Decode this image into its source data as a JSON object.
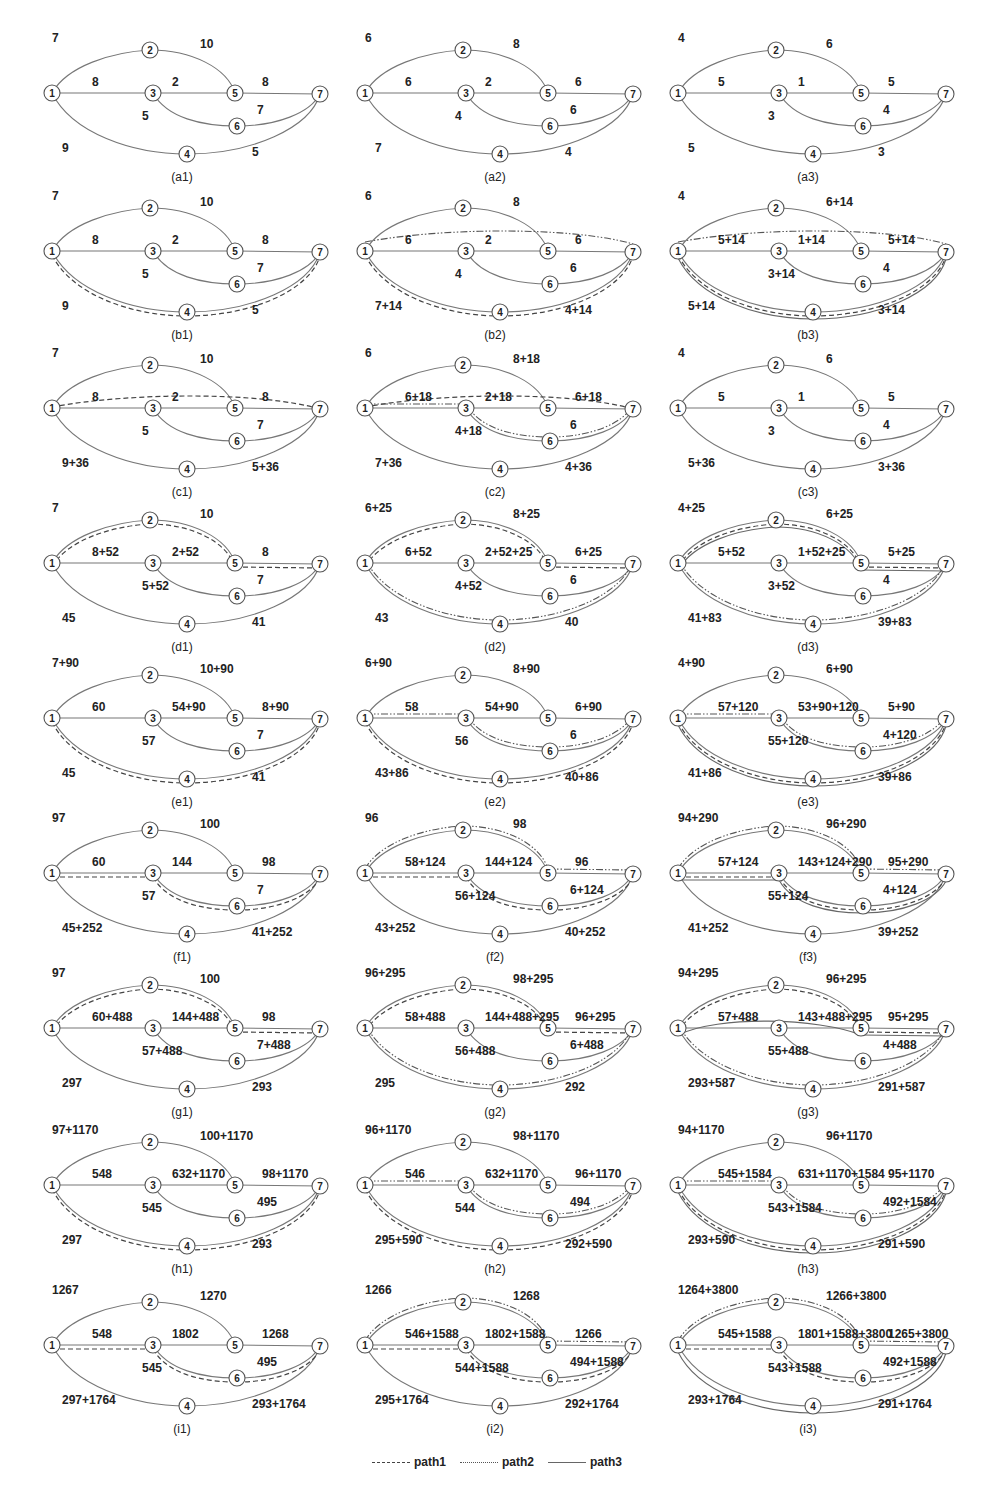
{
  "figure": {
    "nodes": [
      "1",
      "2",
      "3",
      "4",
      "5",
      "6",
      "7"
    ],
    "edges": [
      "1-2",
      "2-5",
      "1-3",
      "3-5",
      "5-7",
      "3-6",
      "6-7",
      "1-4",
      "4-7"
    ],
    "legend": [
      {
        "label": "path1",
        "style": "dashed"
      },
      {
        "label": "path2",
        "style": "dash-dot-dot"
      },
      {
        "label": "path3",
        "style": "solid"
      }
    ]
  },
  "panels": [
    {
      "id": "a1",
      "caption": "(a1)",
      "w": {
        "12": "7",
        "25": "10",
        "13": "8",
        "35": "2",
        "57": "8",
        "36": "5",
        "67": "7",
        "14": "9",
        "47": "5"
      },
      "paths": {
        "p1": [],
        "p2": [],
        "p3": []
      }
    },
    {
      "id": "a2",
      "caption": "(a2)",
      "w": {
        "12": "6",
        "25": "8",
        "13": "6",
        "35": "2",
        "57": "6",
        "36": "4",
        "67": "6",
        "14": "7",
        "47": "4"
      },
      "paths": {
        "p1": [],
        "p2": [],
        "p3": []
      }
    },
    {
      "id": "a3",
      "caption": "(a3)",
      "w": {
        "12": "4",
        "25": "6",
        "13": "5",
        "35": "1",
        "57": "5",
        "36": "3",
        "67": "4",
        "14": "5",
        "47": "3"
      },
      "paths": {
        "p1": [],
        "p2": [],
        "p3": []
      }
    },
    {
      "id": "b1",
      "caption": "(b1)",
      "w": {
        "12": "7",
        "25": "10",
        "13": "8",
        "35": "2",
        "57": "8",
        "36": "5",
        "67": "7",
        "14": "9",
        "47": "5"
      },
      "paths": {
        "p1": [
          "14",
          "47"
        ],
        "p2": [],
        "p3": []
      }
    },
    {
      "id": "b2",
      "caption": "(b2)",
      "w": {
        "12": "6",
        "25": "8",
        "13": "6",
        "35": "2",
        "57": "6",
        "36": "4",
        "67": "6",
        "14": "7+14",
        "47": "4+14"
      },
      "paths": {
        "p1": [
          "14",
          "47"
        ],
        "p2": [
          "17"
        ],
        "p3": []
      }
    },
    {
      "id": "b3",
      "caption": "(b3)",
      "w": {
        "12": "4",
        "25": "6+14",
        "13": "5+14",
        "35": "1+14",
        "57": "5+14",
        "36": "3+14",
        "67": "4",
        "14": "5+14",
        "47": "3+14"
      },
      "paths": {
        "p1": [
          "14",
          "47"
        ],
        "p2": [
          "17"
        ],
        "p3": [
          "14",
          "47"
        ]
      }
    },
    {
      "id": "c1",
      "caption": "(c1)",
      "w": {
        "12": "7",
        "25": "10",
        "13": "8",
        "35": "2",
        "57": "8",
        "36": "5",
        "67": "7",
        "14": "9+36",
        "47": "5+36"
      },
      "paths": {
        "p1": [
          "17"
        ],
        "p2": [],
        "p3": []
      }
    },
    {
      "id": "c2",
      "caption": "(c2)",
      "w": {
        "12": "6",
        "25": "8+18",
        "13": "6+18",
        "35": "2+18",
        "57": "6+18",
        "36": "4+18",
        "67": "6",
        "14": "7+36",
        "47": "4+36"
      },
      "paths": {
        "p1": [
          "17"
        ],
        "p2": [
          "13",
          "36",
          "67"
        ],
        "p3": []
      }
    },
    {
      "id": "c3",
      "caption": "(c3)",
      "w": {
        "12": "4",
        "25": "6",
        "13": "5",
        "35": "1",
        "57": "5",
        "36": "3",
        "67": "4",
        "14": "5+36",
        "47": "3+36"
      },
      "paths": {
        "p1": [],
        "p2": [],
        "p3": []
      }
    },
    {
      "id": "d1",
      "caption": "(d1)",
      "w": {
        "12": "7",
        "25": "10",
        "13": "8+52",
        "35": "2+52",
        "57": "8",
        "36": "5+52",
        "67": "7",
        "14": "45",
        "47": "41"
      },
      "paths": {
        "p1": [
          "12",
          "25",
          "57"
        ],
        "p2": [],
        "p3": []
      }
    },
    {
      "id": "d2",
      "caption": "(d2)",
      "w": {
        "12": "6+25",
        "25": "8+25",
        "13": "6+52",
        "35": "2+52+25",
        "57": "6+25",
        "36": "4+52",
        "67": "6",
        "14": "43",
        "47": "40"
      },
      "paths": {
        "p1": [
          "12",
          "25",
          "57"
        ],
        "p2": [
          "14",
          "47"
        ],
        "p3": []
      }
    },
    {
      "id": "d3",
      "caption": "(d3)",
      "w": {
        "12": "4+25",
        "25": "6+25",
        "13": "5+52",
        "35": "1+52+25",
        "57": "5+25",
        "36": "3+52",
        "67": "4",
        "14": "41+83",
        "47": "39+83"
      },
      "paths": {
        "p1": [
          "12",
          "25",
          "57"
        ],
        "p2": [
          "14",
          "47"
        ],
        "p3": [
          "12",
          "25",
          "57"
        ]
      }
    },
    {
      "id": "e1",
      "caption": "(e1)",
      "w": {
        "12": "7+90",
        "25": "10+90",
        "13": "60",
        "35": "54+90",
        "57": "8+90",
        "36": "57",
        "67": "7",
        "14": "45",
        "47": "41"
      },
      "paths": {
        "p1": [
          "14",
          "47"
        ],
        "p2": [],
        "p3": []
      }
    },
    {
      "id": "e2",
      "caption": "(e2)",
      "w": {
        "12": "6+90",
        "25": "8+90",
        "13": "58",
        "35": "54+90",
        "57": "6+90",
        "36": "56",
        "67": "6",
        "14": "43+86",
        "47": "40+86"
      },
      "paths": {
        "p1": [
          "14",
          "47"
        ],
        "p2": [
          "13",
          "36",
          "67"
        ],
        "p3": []
      }
    },
    {
      "id": "e3",
      "caption": "(e3)",
      "w": {
        "12": "4+90",
        "25": "6+90",
        "13": "57+120",
        "35": "53+90+120",
        "57": "5+90",
        "36": "55+120",
        "67": "4+120",
        "14": "41+86",
        "47": "39+86"
      },
      "paths": {
        "p1": [
          "14",
          "47"
        ],
        "p2": [
          "13",
          "36",
          "67"
        ],
        "p3": [
          "14",
          "47"
        ]
      }
    },
    {
      "id": "f1",
      "caption": "(f1)",
      "w": {
        "12": "97",
        "25": "100",
        "13": "60",
        "35": "144",
        "57": "98",
        "36": "57",
        "67": "7",
        "14": "45+252",
        "47": "41+252"
      },
      "paths": {
        "p1": [
          "13",
          "36",
          "67"
        ],
        "p2": [],
        "p3": []
      }
    },
    {
      "id": "f2",
      "caption": "(f2)",
      "w": {
        "12": "96",
        "25": "98",
        "13": "58+124",
        "35": "144+124",
        "57": "96",
        "36": "56+124",
        "67": "6+124",
        "14": "43+252",
        "47": "40+252"
      },
      "paths": {
        "p1": [
          "13",
          "36",
          "67"
        ],
        "p2": [
          "12",
          "25",
          "57"
        ],
        "p3": []
      }
    },
    {
      "id": "f3",
      "caption": "(f3)",
      "w": {
        "12": "94+290",
        "25": "96+290",
        "13": "57+124",
        "35": "143+124+290",
        "57": "95+290",
        "36": "55+124",
        "67": "4+124",
        "14": "41+252",
        "47": "39+252"
      },
      "paths": {
        "p1": [
          "13",
          "36",
          "67"
        ],
        "p2": [
          "12",
          "25",
          "57"
        ],
        "p3": [
          "13",
          "36",
          "67"
        ]
      }
    },
    {
      "id": "g1",
      "caption": "(g1)",
      "w": {
        "12": "97",
        "25": "100",
        "13": "60+488",
        "35": "144+488",
        "57": "98",
        "36": "57+488",
        "67": "7+488",
        "14": "297",
        "47": "293"
      },
      "paths": {
        "p1": [
          "12",
          "25",
          "57"
        ],
        "p2": [],
        "p3": []
      }
    },
    {
      "id": "g2",
      "caption": "(g2)",
      "w": {
        "12": "96+295",
        "25": "98+295",
        "13": "58+488",
        "35": "144+488+295",
        "57": "96+295",
        "36": "56+488",
        "67": "6+488",
        "14": "295",
        "47": "292"
      },
      "paths": {
        "p1": [
          "12",
          "25",
          "57"
        ],
        "p2": [
          "14",
          "47"
        ],
        "p3": []
      }
    },
    {
      "id": "g3",
      "caption": "(g3)",
      "w": {
        "12": "94+295",
        "25": "96+295",
        "13": "57+488",
        "35": "143+488+295",
        "57": "95+295",
        "36": "55+488",
        "67": "4+488",
        "14": "293+587",
        "47": "291+587"
      },
      "paths": {
        "p1": [
          "12",
          "25",
          "57"
        ],
        "p2": [
          "14",
          "47"
        ],
        "p3": [
          "15",
          "57"
        ]
      }
    },
    {
      "id": "h1",
      "caption": "(h1)",
      "w": {
        "12": "97+1170",
        "25": "100+1170",
        "13": "548",
        "35": "632+1170",
        "57": "98+1170",
        "36": "545",
        "67": "495",
        "14": "297",
        "47": "293"
      },
      "paths": {
        "p1": [
          "14",
          "47"
        ],
        "p2": [],
        "p3": []
      }
    },
    {
      "id": "h2",
      "caption": "(h2)",
      "w": {
        "12": "96+1170",
        "25": "98+1170",
        "13": "546",
        "35": "632+1170",
        "57": "96+1170",
        "36": "544",
        "67": "494",
        "14": "295+590",
        "47": "292+590"
      },
      "paths": {
        "p1": [
          "14",
          "47"
        ],
        "p2": [
          "13",
          "36",
          "67"
        ],
        "p3": []
      }
    },
    {
      "id": "h3",
      "caption": "(h3)",
      "w": {
        "12": "94+1170",
        "25": "96+1170",
        "13": "545+1584",
        "35": "631+1170+1584",
        "57": "95+1170",
        "36": "543+1584",
        "67": "492+1584",
        "14": "293+590",
        "47": "291+590"
      },
      "paths": {
        "p1": [
          "14",
          "47"
        ],
        "p2": [
          "13",
          "36",
          "67"
        ],
        "p3": [
          "14",
          "47"
        ]
      }
    },
    {
      "id": "i1",
      "caption": "(i1)",
      "w": {
        "12": "1267",
        "25": "1270",
        "13": "548",
        "35": "1802",
        "57": "1268",
        "36": "545",
        "67": "495",
        "14": "297+1764",
        "47": "293+1764"
      },
      "paths": {
        "p1": [
          "13",
          "36",
          "67"
        ],
        "p2": [],
        "p3": []
      }
    },
    {
      "id": "i2",
      "caption": "(i2)",
      "w": {
        "12": "1266",
        "25": "1268",
        "13": "546+1588",
        "35": "1802+1588",
        "57": "1266",
        "36": "544+1588",
        "67": "494+1588",
        "14": "295+1764",
        "47": "292+1764"
      },
      "paths": {
        "p1": [
          "13",
          "36",
          "67"
        ],
        "p2": [
          "12",
          "25",
          "57"
        ],
        "p3": []
      }
    },
    {
      "id": "i3",
      "caption": "(i3)",
      "w": {
        "12": "1264+3800",
        "25": "1266+3800",
        "13": "545+1588",
        "35": "1801+1588+3800",
        "57": "1265+3800",
        "36": "543+1588",
        "67": "492+1588",
        "14": "293+1764",
        "47": "291+1764"
      },
      "paths": {
        "p1": [
          "13",
          "36",
          "67"
        ],
        "p2": [
          "12",
          "25",
          "57"
        ],
        "p3": [
          "14",
          "47"
        ]
      }
    }
  ]
}
